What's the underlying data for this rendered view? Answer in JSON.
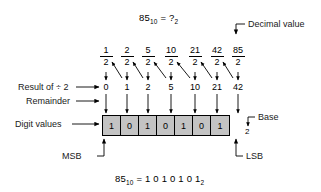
{
  "title_equation": {
    "lhs": "85",
    "lhs_sub": "10",
    "eq": "=",
    "rhs": "?",
    "rhs_sub": "2"
  },
  "bottom_equation": {
    "lhs": "85",
    "lhs_sub": "10",
    "eq": "=",
    "rhs": "1 0 1 0 1 0 1",
    "rhs_sub": "2"
  },
  "divisor": "2",
  "fractions": [
    {
      "numerator": "1",
      "denominator": "2"
    },
    {
      "numerator": "2",
      "denominator": "2"
    },
    {
      "numerator": "5",
      "denominator": "2"
    },
    {
      "numerator": "10",
      "denominator": "2"
    },
    {
      "numerator": "21",
      "denominator": "2"
    },
    {
      "numerator": "42",
      "denominator": "2"
    },
    {
      "numerator": "85",
      "denominator": "2"
    }
  ],
  "quotients": [
    "0",
    "1",
    "2",
    "5",
    "10",
    "21",
    "42"
  ],
  "digits": [
    "1",
    "0",
    "1",
    "0",
    "1",
    "0",
    "1"
  ],
  "base_value": "2",
  "labels": {
    "result_of_div": "Result of ÷ 2",
    "remainder": "Remainder",
    "digit_values": "Digit values",
    "decimal_value": "Decimal value",
    "base": "Base",
    "msb": "MSB",
    "lsb": "LSB"
  },
  "colors": {
    "box_fill": "#c3c3c3",
    "stroke": "#000000",
    "text": "#1a1a1a",
    "background": "#ffffff"
  }
}
